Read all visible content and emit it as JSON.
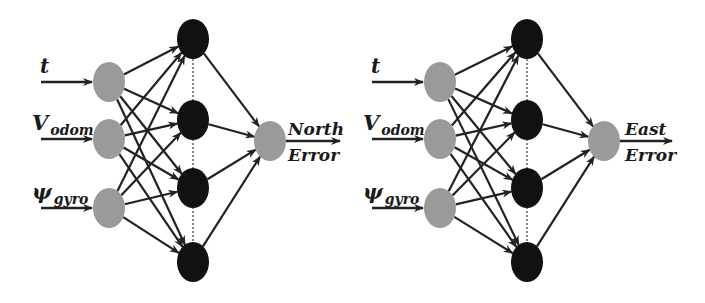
{
  "colors": {
    "input_node": "#9a9a9a",
    "hidden_node": "#111111",
    "output_node": "#9a9a9a",
    "edge": "#222222",
    "background": "#ffffff"
  },
  "networks": [
    {
      "id": "north",
      "inputs": [
        {
          "main": "t",
          "sub": ""
        },
        {
          "main": "V",
          "sub": "odom"
        },
        {
          "main": "ψ",
          "sub": "gyro"
        }
      ],
      "hidden_count": 4,
      "output": {
        "line1": "North",
        "line2": "Error"
      },
      "geometry": {
        "input_x": 109,
        "input_ys": [
          82,
          139,
          208
        ],
        "hidden_x": 193,
        "hidden_ys": [
          39,
          120,
          188,
          262
        ],
        "output_x": 270,
        "output_y": 141,
        "arrow_start_x": 41,
        "out_arrow_end_x": 340,
        "label_x": 32,
        "out_label_x": 288
      }
    },
    {
      "id": "east",
      "inputs": [
        {
          "main": "t",
          "sub": ""
        },
        {
          "main": "V",
          "sub": "odom"
        },
        {
          "main": "ψ",
          "sub": "gyro"
        }
      ],
      "hidden_count": 4,
      "output": {
        "line1": "East",
        "line2": "Error"
      },
      "geometry": {
        "input_x": 440,
        "input_ys": [
          82,
          139,
          208
        ],
        "hidden_x": 527,
        "hidden_ys": [
          39,
          120,
          188,
          262
        ],
        "output_x": 604,
        "output_y": 141,
        "arrow_start_x": 372,
        "out_arrow_end_x": 672,
        "label_x": 363,
        "out_label_x": 625
      }
    }
  ]
}
